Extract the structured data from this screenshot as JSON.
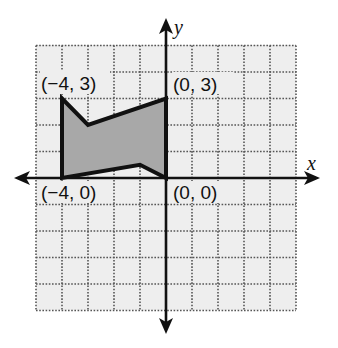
{
  "diagram": {
    "type": "coordinate-plane",
    "grid": {
      "x_min": -5,
      "x_max": 5,
      "y_min": -5,
      "y_max": 5,
      "step": 1
    },
    "axes": {
      "x_label": "x",
      "y_label": "y"
    },
    "polygon": {
      "vertices": [
        [
          -4,
          3
        ],
        [
          -3,
          2
        ],
        [
          0,
          3
        ],
        [
          0,
          0
        ],
        [
          -1,
          0.5
        ],
        [
          -4,
          0
        ]
      ],
      "fill": "#a8a8a8",
      "stroke": "#111111"
    },
    "labels": {
      "top_left": "(−4, 3)",
      "top_right": "(0, 3)",
      "bottom_left": "(−4, 0)",
      "bottom_right": "(0, 0)"
    },
    "colors": {
      "grid_background": "#eeeeee",
      "grid_lines": "#555555",
      "axes": "#111111"
    }
  }
}
